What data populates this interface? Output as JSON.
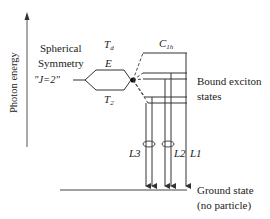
{
  "axis": {
    "label": "Photon energy"
  },
  "labels": {
    "spherical_line1": "Spherical",
    "spherical_line2": "Symmetry",
    "j_state": "\"J=2\"",
    "td_main": "T",
    "td_sub": "d",
    "e_level": "E",
    "t2_main": "T",
    "t2_sub": "2",
    "c1h_main": "C",
    "c1h_sub": "1h",
    "bound_line1": "Bound exciton",
    "bound_line2": "states",
    "ground_line1": "Ground state",
    "ground_line2": "(no particle)",
    "l1": "L1",
    "l2": "L2",
    "l3": "L3"
  },
  "colors": {
    "line": "#333333",
    "background": "#ffffff"
  }
}
